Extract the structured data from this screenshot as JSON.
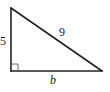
{
  "diagram": {
    "type": "right-triangle",
    "colors": {
      "stroke": "#222222",
      "background": "#ffffff"
    },
    "vertices": {
      "top": [
        11,
        8
      ],
      "right_angle": [
        11,
        71
      ],
      "right": [
        102,
        71
      ]
    },
    "labels": {
      "vertical_leg": "5",
      "hypotenuse": "9",
      "horizontal_leg": "b"
    },
    "right_angle_marker": true
  }
}
